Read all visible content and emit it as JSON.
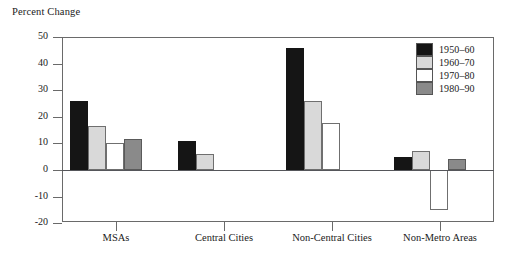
{
  "chart_data": {
    "type": "bar",
    "title": "Percent Change",
    "xlabel": "",
    "ylabel": "Percent Change",
    "ylim": [
      -20,
      50
    ],
    "yticks": [
      50,
      40,
      30,
      20,
      10,
      0,
      -10,
      -20
    ],
    "ytick_labels": [
      "50",
      "40",
      "30",
      "20",
      "10",
      "0",
      "-10",
      "-20"
    ],
    "grid": false,
    "legend_position": "top-right",
    "categories": [
      "MSAs",
      "Central Cities",
      "Non-Central Cities",
      "Non-Metro Areas"
    ],
    "series": [
      {
        "name": "1950-60",
        "color": "#151515",
        "values": [
          26,
          11,
          46,
          5
        ]
      },
      {
        "name": "1960-70",
        "color": "#d9d9d9",
        "values": [
          16.5,
          6,
          26,
          7
        ]
      },
      {
        "name": "1970-80",
        "color": "#ffffff",
        "values": [
          10,
          null,
          17.5,
          -15
        ]
      },
      {
        "name": "1980-90",
        "color": "#8a8a8a",
        "values": [
          11.5,
          null,
          null,
          4
        ]
      }
    ]
  },
  "legend": {
    "entries": [
      {
        "label": "1950–60"
      },
      {
        "label": "1960–70"
      },
      {
        "label": "1970–80"
      },
      {
        "label": "1980–90"
      }
    ]
  }
}
